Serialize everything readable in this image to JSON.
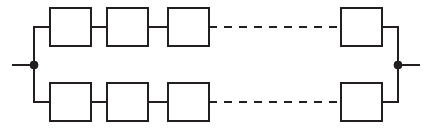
{
  "diagram": {
    "type": "reliability-block-diagram",
    "colors": {
      "line": "#231f20",
      "block_fill": "#ffffff",
      "background": "#ffffff",
      "node": "#231f20"
    },
    "canvas": {
      "width": 427,
      "height": 132
    },
    "geometry": {
      "block_width": 41,
      "block_height": 38,
      "stroke_width": 2,
      "top_row_y": 8,
      "bottom_row_y": 83,
      "top_wire_y": 27,
      "bottom_wire_y": 102,
      "left_bus_x": 34,
      "right_bus_x": 398,
      "node_y": 65,
      "node_radius": 4,
      "dash_pattern": "8 7"
    },
    "terminals": [
      {
        "id": "left-terminal",
        "label": "",
        "x": 34,
        "y": 65,
        "lead_from_x": 12,
        "lead_to_x": 34
      },
      {
        "id": "right-terminal",
        "label": "",
        "x": 398,
        "y": 65,
        "lead_from_x": 398,
        "lead_to_x": 420
      }
    ],
    "branches": [
      {
        "id": "top-branch",
        "label": "",
        "row_y": 8,
        "wire_y": 27,
        "blocks": [
          {
            "id": "top-block-1",
            "label": "",
            "x": 50,
            "y": 8
          },
          {
            "id": "top-block-2",
            "label": "",
            "x": 107,
            "y": 8
          },
          {
            "id": "top-block-3",
            "label": "",
            "x": 168,
            "y": 8
          },
          {
            "id": "top-block-n",
            "label": "",
            "x": 341,
            "y": 8
          }
        ],
        "connectors": [
          {
            "id": "top-conn-1",
            "style": "solid",
            "x1": 91,
            "x2": 107
          },
          {
            "id": "top-conn-2",
            "style": "solid",
            "x1": 148,
            "x2": 168
          },
          {
            "id": "top-conn-ellipsis",
            "style": "dashed",
            "x1": 209,
            "x2": 341
          }
        ],
        "bus_leads": [
          {
            "id": "top-left-lead",
            "x1": 34,
            "x2": 50
          },
          {
            "id": "top-right-lead",
            "x1": 382,
            "x2": 398
          }
        ]
      },
      {
        "id": "bottom-branch",
        "label": "",
        "row_y": 83,
        "wire_y": 102,
        "blocks": [
          {
            "id": "bottom-block-1",
            "label": "",
            "x": 50,
            "y": 83
          },
          {
            "id": "bottom-block-2",
            "label": "",
            "x": 107,
            "y": 83
          },
          {
            "id": "bottom-block-3",
            "label": "",
            "x": 168,
            "y": 83
          },
          {
            "id": "bottom-block-n",
            "label": "",
            "x": 341,
            "y": 83
          }
        ],
        "connectors": [
          {
            "id": "bottom-conn-1",
            "style": "solid",
            "x1": 91,
            "x2": 107
          },
          {
            "id": "bottom-conn-2",
            "style": "solid",
            "x1": 148,
            "x2": 168
          },
          {
            "id": "bottom-conn-ellipsis",
            "style": "dashed",
            "x1": 209,
            "x2": 341
          }
        ],
        "bus_leads": [
          {
            "id": "bottom-left-lead",
            "x1": 34,
            "x2": 50
          },
          {
            "id": "bottom-right-lead",
            "x1": 382,
            "x2": 398
          }
        ]
      }
    ],
    "buses": [
      {
        "id": "left-bus",
        "x": 34,
        "y1": 27,
        "y2": 102
      },
      {
        "id": "right-bus",
        "x": 398,
        "y1": 27,
        "y2": 102
      }
    ]
  }
}
